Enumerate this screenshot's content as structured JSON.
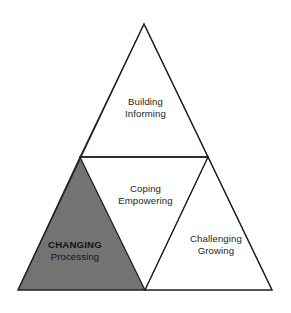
{
  "diagram": {
    "type": "nested-triangle-model",
    "background_color": "#ffffff",
    "stroke_color": "#231f20",
    "shaded_fill_color": "#737373",
    "unshaded_fill_color": "#ffffff",
    "text_color": "#231f20",
    "segments": [
      {
        "id": "top",
        "name": "Building Informing",
        "primary": "Building",
        "secondary": "Informing",
        "shaded": false,
        "emphasis": false
      },
      {
        "id": "middle",
        "name": "Coping Empowering",
        "primary": "Coping",
        "secondary": "Empowering",
        "shaded": false,
        "emphasis": false
      },
      {
        "id": "left",
        "name": "Changing Processing",
        "primary": "CHANGING",
        "secondary": "Processing",
        "shaded": true,
        "emphasis": true
      },
      {
        "id": "right",
        "name": "Challenging Growing",
        "primary": "Challenging",
        "secondary": "Growing",
        "shaded": false,
        "emphasis": false
      }
    ]
  }
}
